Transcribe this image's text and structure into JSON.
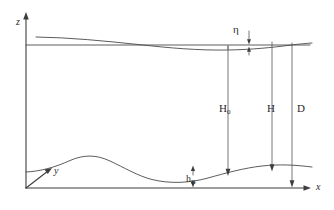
{
  "figure": {
    "kind": "schematic-diagram",
    "background_color": "#ffffff",
    "line_color": "#4a4a4a",
    "text_color": "#2b2b2b"
  },
  "axes": {
    "vertical": {
      "name": "z-axis",
      "label": "z"
    },
    "horizontal": {
      "name": "x-axis",
      "label": "x"
    },
    "depth": {
      "name": "y-axis",
      "label": "y"
    }
  },
  "curves": {
    "free_surface": {
      "name": "free-surface-wave",
      "label": ""
    },
    "still_water_level": {
      "name": "still-water-level-line",
      "label": ""
    },
    "seabed": {
      "name": "seabed-profile",
      "label": ""
    }
  },
  "dimensions": [
    {
      "id": "eta",
      "label": "η",
      "name": "wave-elevation-eta"
    },
    {
      "id": "H0",
      "label": "H",
      "sub": "0",
      "name": "still-water-depth-H0"
    },
    {
      "id": "H",
      "label": "H",
      "sub": "",
      "name": "total-water-depth-H"
    },
    {
      "id": "D",
      "label": "D",
      "sub": "",
      "name": "reference-depth-D"
    },
    {
      "id": "hB",
      "label": "h",
      "sub": "B",
      "name": "bed-elevation-hB"
    }
  ]
}
